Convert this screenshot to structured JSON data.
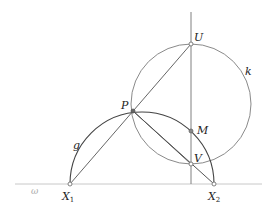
{
  "diagram": {
    "colors": {
      "line": "#707070",
      "dark_line": "#444444",
      "baseline": "#c8c8c8",
      "point_fill": "#ffffff",
      "point_stroke": "#666666",
      "label": "#222222"
    },
    "points": {
      "U": {
        "label": "U",
        "x": 191,
        "y": 44
      },
      "P": {
        "label": "P",
        "x": 133,
        "y": 111
      },
      "M": {
        "label": "M",
        "x": 191,
        "y": 131
      },
      "V": {
        "label": "V",
        "x": 191,
        "y": 164
      },
      "X1": {
        "label": "X",
        "sub": "1",
        "x": 70,
        "y": 184
      },
      "X2": {
        "label": "X",
        "sub": "2",
        "x": 214,
        "y": 184
      }
    },
    "curves": {
      "k": {
        "label": "k",
        "cx": 191,
        "cy": 104,
        "r": 60
      },
      "g": {
        "label": "g",
        "cx": 142,
        "cy": 184,
        "r": 72
      }
    },
    "baseline": {
      "label": "ω",
      "x1": 15,
      "x2": 262,
      "y": 184
    },
    "vertical_line": {
      "x": 191,
      "y1": 12,
      "y2": 184
    }
  }
}
